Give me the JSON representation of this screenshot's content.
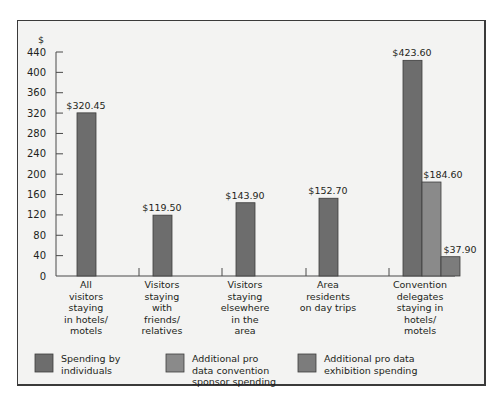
{
  "chart_data": {
    "type": "bar",
    "title": "",
    "ylabel": "$",
    "xlabel": "",
    "ylim": [
      0,
      440
    ],
    "yticks": [
      0,
      40,
      80,
      120,
      160,
      200,
      240,
      280,
      320,
      360,
      400,
      440
    ],
    "grid": false,
    "legend_position": "bottom",
    "categories": [
      "All visitors staying in hotels/ motels",
      "Visitors staying with friends/ relatives",
      "Visitors staying elsewhere in the area",
      "Area residents on day trips",
      "Convention delegates staying in hotels/ motels"
    ],
    "series": [
      {
        "name": "Spending by individuals",
        "color": "#6d6d6d",
        "values": [
          320.45,
          119.5,
          143.9,
          152.7,
          423.6
        ]
      },
      {
        "name": "Additional pro data convention sponsor spending",
        "color": "#8a8a8a",
        "values": [
          null,
          null,
          null,
          null,
          184.6
        ]
      },
      {
        "name": "Additional pro data exhibition spending",
        "color": "#7c7c7c",
        "values": [
          null,
          null,
          null,
          null,
          37.9
        ]
      }
    ],
    "data_labels": [
      {
        "category": 0,
        "series": 0,
        "text": "$320.45"
      },
      {
        "category": 1,
        "series": 0,
        "text": "$119.50"
      },
      {
        "category": 2,
        "series": 0,
        "text": "$143.90"
      },
      {
        "category": 3,
        "series": 0,
        "text": "$152.70"
      },
      {
        "category": 4,
        "series": 0,
        "text": "$423.60"
      },
      {
        "category": 4,
        "series": 1,
        "text": "$184.60"
      },
      {
        "category": 4,
        "series": 2,
        "text": "$37.90"
      }
    ]
  },
  "axis": {
    "y_unit": "$",
    "tick_labels": [
      "0",
      "40",
      "80",
      "120",
      "160",
      "200",
      "240",
      "280",
      "320",
      "360",
      "400",
      "440"
    ]
  },
  "category_labels": [
    [
      "All",
      "visitors",
      "staying",
      "in hotels/",
      "motels"
    ],
    [
      "Visitors",
      "staying",
      "with",
      "friends/",
      "relatives"
    ],
    [
      "Visitors",
      "staying",
      "elsewhere",
      "in the",
      "area"
    ],
    [
      "Area",
      "residents",
      "on day trips"
    ],
    [
      "Convention",
      "delegates",
      "staying in",
      "hotels/",
      "motels"
    ]
  ],
  "legend": [
    {
      "lines": [
        "Spending by",
        "individuals"
      ],
      "color": "#6d6d6d"
    },
    {
      "lines": [
        "Additional pro",
        "data convention",
        "sponsor spending"
      ],
      "color": "#8a8a8a"
    },
    {
      "lines": [
        "Additional pro data",
        "exhibition spending"
      ],
      "color": "#7c7c7c"
    }
  ],
  "colors": {
    "background": "#f3f3f2",
    "frame": "#3a3a3a",
    "axis": "#4a4a4a",
    "text": "#231f20"
  }
}
